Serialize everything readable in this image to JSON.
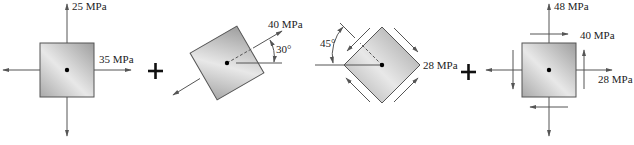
{
  "diagram": {
    "panels": [
      {
        "id": "element-1",
        "normal_stress_vertical": "25 MPa",
        "normal_stress_horizontal": "35 MPa"
      },
      {
        "id": "element-2",
        "stress": "40 MPa",
        "angle": "30°"
      },
      {
        "id": "element-3",
        "shear_stress": "28 MPa",
        "angle": "45°"
      },
      {
        "id": "element-result",
        "normal_stress_vertical": "48 MPa",
        "shear_stress": "40 MPa",
        "normal_stress_horizontal": "28 MPa"
      }
    ],
    "operators": [
      "+",
      "+"
    ],
    "colors": {
      "element_fill_light": "#e6e6e6",
      "element_fill_dark": "#a8a8a8",
      "line": "#555555",
      "text": "#222222"
    }
  }
}
